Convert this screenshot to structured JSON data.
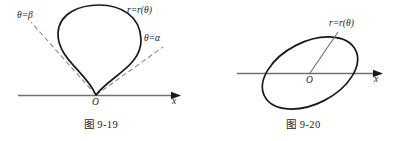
{
  "figures": [
    {
      "id": "fig-9-19",
      "caption": "图 9-19",
      "axis_label": "x",
      "origin_label": "O",
      "labels": {
        "curve": "r=r(θ)",
        "ray_beta": "θ=β",
        "ray_alpha": "θ=α"
      },
      "description": "Teardrop shaped polar curve with cusp at origin, bounded by dashed rays theta=alpha and theta=beta",
      "colors": {
        "curve": "#1a1a1a",
        "axis": "#707070",
        "dashed_ray": "#8c8c8c"
      }
    },
    {
      "id": "fig-9-20",
      "caption": "图 9-20",
      "axis_label": "x",
      "origin_label": "O",
      "labels": {
        "curve": "r=r(θ)"
      },
      "description": "Tilted closed oval (ellipse) centered at origin with a radius vector drawn from O to the curve",
      "colors": {
        "curve": "#1a1a1a",
        "axis": "#707070",
        "radius": "#6e6e6e"
      }
    }
  ]
}
